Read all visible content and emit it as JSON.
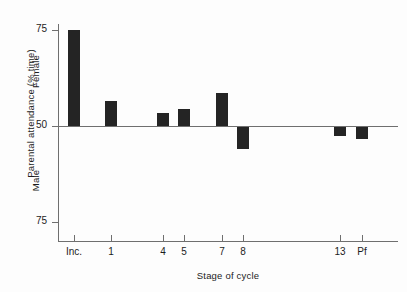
{
  "chart_data": {
    "type": "bar",
    "title": "",
    "xlabel": "Stage of cycle",
    "ylabel": "Parental attendance (% time)",
    "categories": [
      "Inc.",
      "1",
      "4",
      "5",
      "7",
      "8",
      "13",
      "Pf"
    ],
    "values": [
      74.0,
      56.5,
      53.4,
      54.4,
      58.6,
      44.3,
      48.8,
      48.2
    ],
    "baseline": 50,
    "ylim": [
      75,
      75
    ],
    "y_tick_labels": [
      "75",
      "50",
      "75"
    ],
    "y_tick_values": [
      75,
      50,
      75
    ],
    "group_labels": {
      "upper": "Female",
      "lower": "Male"
    },
    "grid": false,
    "legend": "none",
    "bar_color": "#242424",
    "axis_color": "#6f6f6f",
    "note": "Values above the 50 baseline indicate female attendance, values below indicate male attendance."
  },
  "axes": {
    "y_title": "Parental attendance (% time)",
    "x_title": "Stage of cycle",
    "y_ticks": [
      {
        "label": "75",
        "pos_px": 30
      },
      {
        "label": "50",
        "pos_px": 126
      },
      {
        "label": "75",
        "pos_px": 222
      }
    ],
    "x_ticks": [
      {
        "label": "Inc.",
        "pos_px": 74
      },
      {
        "label": "1",
        "pos_px": 111
      },
      {
        "label": "4",
        "pos_px": 163
      },
      {
        "label": "5",
        "pos_px": 184
      },
      {
        "label": "7",
        "pos_px": 222
      },
      {
        "label": "8",
        "pos_px": 243
      },
      {
        "label": "13",
        "pos_px": 340
      },
      {
        "label": "Pf",
        "pos_px": 362
      }
    ],
    "female_label": "Female",
    "male_label": "Male"
  },
  "bars": [
    {
      "category": "Inc.",
      "value": 74.0,
      "x_px": 68,
      "top_px": 30,
      "height_px": 96,
      "direction": "up"
    },
    {
      "category": "1",
      "value": 56.5,
      "x_px": 105,
      "top_px": 101,
      "height_px": 25,
      "direction": "up"
    },
    {
      "category": "4",
      "value": 53.4,
      "x_px": 157,
      "top_px": 113,
      "height_px": 13,
      "direction": "up"
    },
    {
      "category": "5",
      "value": 54.4,
      "x_px": 178,
      "top_px": 109,
      "height_px": 17,
      "direction": "up"
    },
    {
      "category": "7",
      "value": 58.6,
      "x_px": 216,
      "top_px": 93,
      "height_px": 33,
      "direction": "up"
    },
    {
      "category": "8",
      "value": 44.3,
      "x_px": 237,
      "top_px": 127,
      "height_px": 22,
      "direction": "down"
    },
    {
      "category": "13",
      "value": 48.8,
      "x_px": 334,
      "top_px": 127,
      "height_px": 9,
      "direction": "down"
    },
    {
      "category": "Pf",
      "value": 48.2,
      "x_px": 356,
      "top_px": 127,
      "height_px": 12,
      "direction": "down"
    }
  ]
}
